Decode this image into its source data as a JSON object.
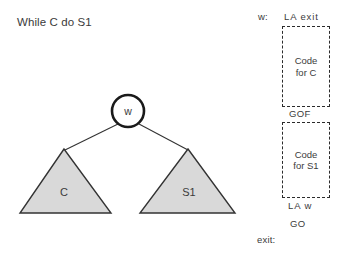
{
  "diagram": {
    "title": "While C do S1",
    "tree": {
      "root_node_label": "w",
      "children": [
        {
          "label": "C"
        },
        {
          "label": "S1"
        }
      ],
      "node_fill": "#ffffff",
      "node_stroke": "#1a1a1a",
      "triangle_fill": "#d9d9d9",
      "triangle_stroke": "#333333",
      "edge_stroke": "#333333"
    },
    "code_column": {
      "label_w": "w:",
      "line_la_exit": "LA  exit",
      "box_c": "Code\nfor C",
      "line_gof": "GOF",
      "box_s1": "Code\nfor S1",
      "line_la_w": "LA  w",
      "line_go": "GO",
      "label_exit": "exit:"
    }
  }
}
